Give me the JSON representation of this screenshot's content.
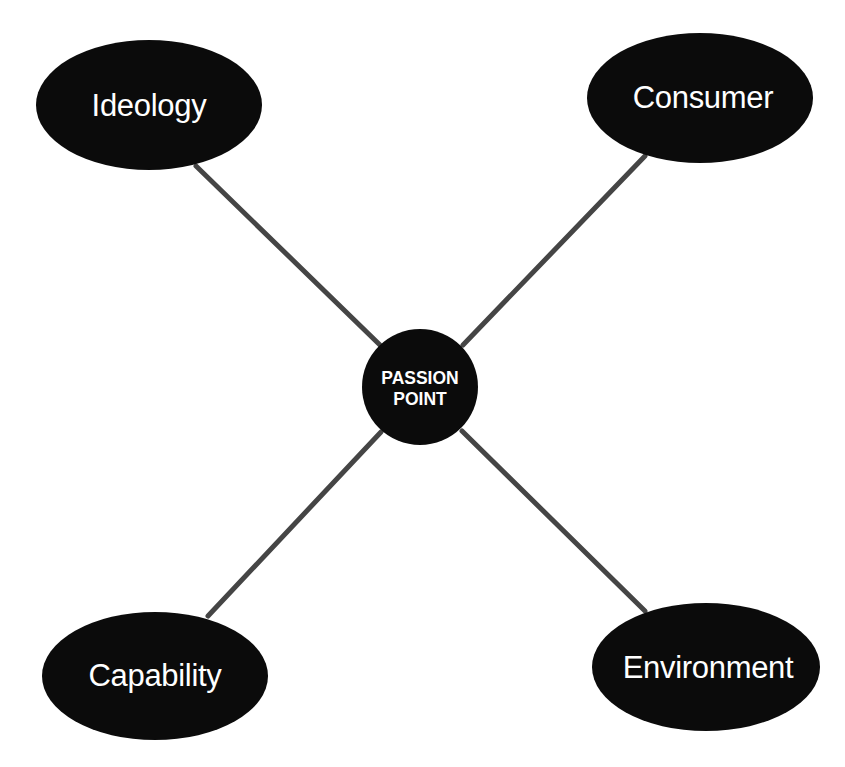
{
  "diagram": {
    "type": "radial-concept-map",
    "center": {
      "label_line1": "PASSION",
      "label_line2": "POINT",
      "cx": 420,
      "cy": 387,
      "r": 58
    },
    "nodes": [
      {
        "id": "ideology",
        "label": "Ideology",
        "cx": 149,
        "cy": 105,
        "rx": 113,
        "ry": 65
      },
      {
        "id": "consumer",
        "label": "Consumer",
        "cx": 700,
        "cy": 98,
        "rx": 113,
        "ry": 65
      },
      {
        "id": "capability",
        "label": "Capability",
        "cx": 155,
        "cy": 676,
        "rx": 113,
        "ry": 64
      },
      {
        "id": "environment",
        "label": "Environment",
        "cx": 706,
        "cy": 667,
        "rx": 114,
        "ry": 64
      }
    ],
    "edges": [
      {
        "from": "ideology",
        "to": "center"
      },
      {
        "from": "consumer",
        "to": "center"
      },
      {
        "from": "capability",
        "to": "center"
      },
      {
        "from": "environment",
        "to": "center"
      }
    ],
    "colors": {
      "node_fill": "#0b0b0b",
      "node_text": "#ffffff",
      "edge": "#454545",
      "background": "#ffffff"
    }
  }
}
